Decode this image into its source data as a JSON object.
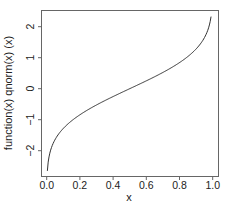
{
  "chart_data": {
    "type": "line",
    "title": "",
    "xlabel": "x",
    "ylabel": "function(x) qnorm(x) (x)",
    "function": "qnorm",
    "x_range": [
      0.004,
      0.99
    ],
    "xlim": [
      -0.0354,
      1.0294
    ],
    "ylim": [
      -2.84,
      2.53
    ],
    "x_ticks": [
      0.0,
      0.2,
      0.4,
      0.6,
      0.8,
      1.0
    ],
    "x_tick_labels": [
      "0.0",
      "0.2",
      "0.4",
      "0.6",
      "0.8",
      "1.0"
    ],
    "y_ticks": [
      -2,
      -1,
      0,
      1,
      2
    ],
    "y_tick_labels": [
      "-2",
      "-1",
      "0",
      "1",
      "2"
    ],
    "grid": false,
    "legend": null,
    "series": [
      {
        "name": "qnorm(x)",
        "x": [
          0.004,
          0.01,
          0.02,
          0.05,
          0.1,
          0.2,
          0.3,
          0.4,
          0.5,
          0.6,
          0.7,
          0.8,
          0.9,
          0.95,
          0.98,
          0.99
        ],
        "y": [
          -2.652,
          -2.326,
          -2.054,
          -1.645,
          -1.282,
          -0.842,
          -0.524,
          -0.253,
          0.0,
          0.253,
          0.524,
          0.842,
          1.282,
          1.645,
          2.054,
          2.326
        ]
      }
    ],
    "colors": {
      "line": "#333333",
      "axis": "#555555",
      "text": "#222222"
    }
  }
}
